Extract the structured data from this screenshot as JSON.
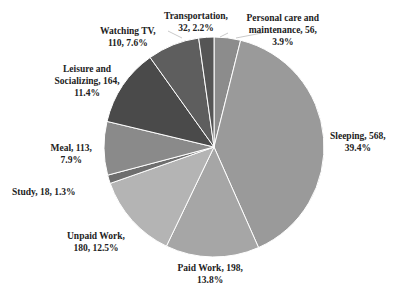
{
  "chart_data": {
    "type": "pie",
    "title": "",
    "unit": "minutes",
    "start_angle_deg": 0,
    "direction": "clockwise",
    "slices": [
      {
        "label": "Personal care and maintenance",
        "value": 56,
        "percent": "3.9%",
        "color": "#8c8c8c",
        "text": "Personal care and\nmaintenance, 56,\n3.9%"
      },
      {
        "label": "Sleeping",
        "value": 568,
        "percent": "39.4%",
        "color": "#9a9a9a",
        "text": "Sleeping, 568,\n39.4%"
      },
      {
        "label": "Paid Work",
        "value": 198,
        "percent": "13.8%",
        "color": "#a6a6a6",
        "text": "Paid Work, 198,\n13.8%"
      },
      {
        "label": "Unpaid Work",
        "value": 180,
        "percent": "12.5%",
        "color": "#b4b4b4",
        "text": "Unpaid Work,\n180, 12.5%"
      },
      {
        "label": "Study",
        "value": 18,
        "percent": "1.3%",
        "color": "#6e6e6e",
        "text": "Study, 18, 1.3%"
      },
      {
        "label": "Meal",
        "value": 113,
        "percent": "7.9%",
        "color": "#8a8a8a",
        "text": "Meal, 113,\n7.9%"
      },
      {
        "label": "Leisure and Socializing",
        "value": 164,
        "percent": "11.4%",
        "color": "#4a4a4a",
        "text": "Leisure and\nSocializing, 164,\n11.4%"
      },
      {
        "label": "Watching TV",
        "value": 110,
        "percent": "7.6%",
        "color": "#5e5e5e",
        "text": "Watching TV,\n110, 7.6%"
      },
      {
        "label": "Transportation",
        "value": 32,
        "percent": "2.2%",
        "color": "#555555",
        "text": "Transportation,\n32, 2.2%"
      }
    ],
    "legend": "none (data labels)"
  },
  "labels": [
    {
      "text": "Personal care and\nmaintenance, 56,\n3.9%",
      "x": 283,
      "y": 12
    },
    {
      "text": "Sleeping, 568,\n39.4%",
      "x": 358,
      "y": 130
    },
    {
      "text": "Paid Work, 198,\n13.8%",
      "x": 210,
      "y": 262
    },
    {
      "text": "Unpaid Work,\n180, 12.5%",
      "x": 96,
      "y": 230
    },
    {
      "text": "Study, 18, 1.3%",
      "x": 44,
      "y": 186
    },
    {
      "text": "Meal, 113,\n7.9%",
      "x": 71,
      "y": 142
    },
    {
      "text": "Leisure and\nSocializing, 164,\n11.4%",
      "x": 87,
      "y": 63
    },
    {
      "text": "Watching TV,\n110, 7.6%",
      "x": 128,
      "y": 25
    },
    {
      "text": "Transportation,\n32, 2.2%",
      "x": 196,
      "y": 10
    }
  ]
}
